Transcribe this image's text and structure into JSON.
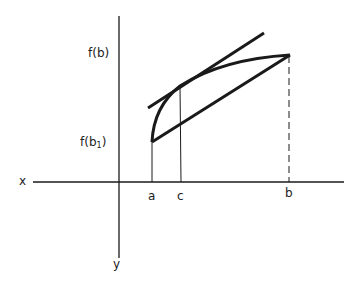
{
  "diagram": {
    "type": "mean-value-theorem",
    "labels": {
      "fb": "f(b)",
      "fb1_main": "f(b",
      "fb1_sub": "1",
      "fb1_close": ")",
      "x_axis": "x",
      "y_axis": "y",
      "a": "a",
      "c": "c",
      "b": "b"
    },
    "colors": {
      "stroke": "#1a1a1a",
      "background": "#ffffff"
    }
  }
}
